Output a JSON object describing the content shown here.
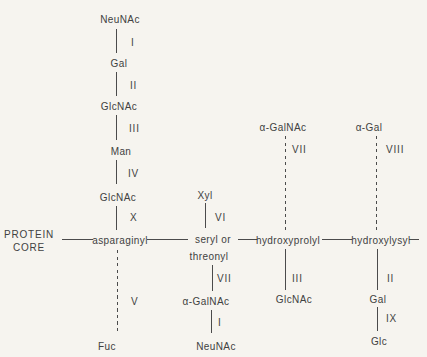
{
  "figure": {
    "background_color": "#f6f4ef",
    "text_color": "#414141",
    "line_color": "#4b4b4b"
  },
  "protein_core": {
    "line1": "PROTEIN",
    "line2": "CORE"
  },
  "chains": {
    "asparaginyl": {
      "residue": "asparaginyl",
      "upper": {
        "style": "solid",
        "sugars": [
          "NeuNAc",
          "Gal",
          "GlcNAc",
          "Man",
          "GlcNAc"
        ],
        "linkages": [
          "I",
          "II",
          "III",
          "IV",
          "X"
        ]
      },
      "lower": {
        "style": "dashed",
        "sugars": [
          "Fuc"
        ],
        "linkages": [
          "V"
        ]
      }
    },
    "seryl_threonyl": {
      "residue_line1": "seryl or",
      "residue_line2": "threonyl",
      "upper": {
        "style": "solid",
        "sugars": [
          "Xyl"
        ],
        "linkages": [
          "VI"
        ]
      },
      "lower": {
        "style": "solid",
        "sugars": [
          "α-GalNAc",
          "NeuNAc"
        ],
        "linkages": [
          "VII",
          "I"
        ]
      }
    },
    "hydroxyprolyl": {
      "residue": "hydroxyprolyl",
      "upper": {
        "style": "dashed",
        "sugars": [
          "α-GalNAc"
        ],
        "linkages": [
          "VII"
        ]
      },
      "lower": {
        "style": "solid",
        "sugars": [
          "GlcNAc"
        ],
        "linkages": [
          "III"
        ]
      }
    },
    "hydroxylysyl": {
      "residue": "hydroxylysyl",
      "upper": {
        "style": "dashed",
        "sugars": [
          "α-Gal"
        ],
        "linkages": [
          "VIII"
        ]
      },
      "lower": {
        "style": "solid",
        "sugars": [
          "Gal",
          "Glc"
        ],
        "linkages": [
          "II",
          "IX"
        ]
      }
    }
  }
}
